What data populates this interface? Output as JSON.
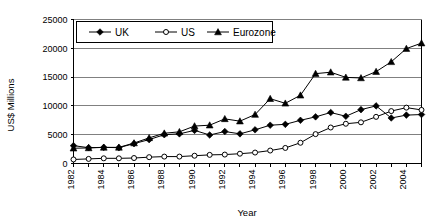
{
  "chart_data": {
    "type": "line",
    "title": "",
    "xlabel": "Year",
    "ylabel": "US$ Millions",
    "xlim": [
      1982,
      2005
    ],
    "ylim": [
      0,
      25000
    ],
    "ytick_values": [
      0,
      5000,
      10000,
      15000,
      20000,
      25000
    ],
    "ytick_labels": [
      "0",
      "5000",
      "10000",
      "15000",
      "20000",
      "25000"
    ],
    "xtick_values": [
      1982,
      1984,
      1986,
      1988,
      1990,
      1992,
      1994,
      1996,
      1998,
      2000,
      2002,
      2004
    ],
    "xtick_labels": [
      "1982",
      "1984",
      "1986",
      "1988",
      "1990",
      "1992",
      "1994",
      "1996",
      "1998",
      "2000",
      "2002",
      "2004"
    ],
    "x": [
      1982,
      1983,
      1984,
      1985,
      1986,
      1987,
      1988,
      1989,
      1990,
      1991,
      1992,
      1993,
      1994,
      1995,
      1996,
      1997,
      1998,
      1999,
      2000,
      2001,
      2002,
      2003,
      2004,
      2005
    ],
    "grid": true,
    "grid_axis": "y",
    "legend_position": "top-left-inside",
    "series": [
      {
        "name": "UK",
        "marker": "filled-diamond",
        "color": "#000000",
        "values": [
          3100,
          2750,
          2800,
          2750,
          3450,
          4150,
          5000,
          5150,
          5750,
          4950,
          5550,
          5150,
          5850,
          6650,
          6800,
          7500,
          8100,
          8850,
          8200,
          9350,
          10000,
          7900,
          8400,
          8500
        ]
      },
      {
        "name": "US",
        "marker": "open-circle",
        "color": "#000000",
        "values": [
          700,
          800,
          900,
          900,
          950,
          1100,
          1200,
          1200,
          1350,
          1500,
          1550,
          1700,
          1900,
          2250,
          2700,
          3600,
          5100,
          6250,
          6900,
          7150,
          8100,
          9100,
          9700,
          9300
        ]
      },
      {
        "name": "Eurozone",
        "marker": "filled-triangle",
        "color": "#000000",
        "values": [
          2650,
          2700,
          2800,
          2800,
          3550,
          4450,
          5250,
          5500,
          6500,
          6650,
          7750,
          7350,
          8500,
          11250,
          10450,
          11850,
          15600,
          15850,
          14950,
          14850,
          15950,
          17650,
          19950,
          20900
        ]
      }
    ]
  },
  "axis": {
    "y_title": "US$ Millions",
    "x_title": "Year"
  },
  "legend": {
    "items": [
      {
        "label": "UK",
        "marker": "filled-diamond"
      },
      {
        "label": "US",
        "marker": "open-circle"
      },
      {
        "label": "Eurozone",
        "marker": "filled-triangle"
      }
    ]
  }
}
